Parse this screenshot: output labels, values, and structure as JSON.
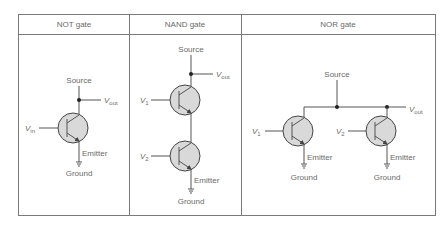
{
  "table": {
    "columns": [
      {
        "header": "NOT gate"
      },
      {
        "header": "NAND gate"
      },
      {
        "header": "NOR gate"
      }
    ]
  },
  "labels": {
    "source": "Source",
    "ground": "Ground",
    "emitter": "Emitter",
    "v": "V",
    "out_sub": "out",
    "in_sub": "in",
    "one_sub": "1",
    "two_sub": "2"
  },
  "colors": {
    "transistor_fill": "#d9d9d9",
    "wire": "#555555",
    "text": "#6a6a6a",
    "border": "#7a7a7a"
  }
}
